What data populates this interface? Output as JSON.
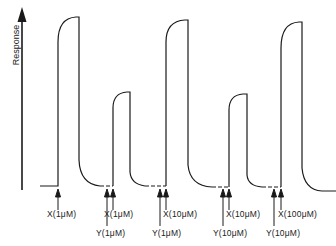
{
  "diagram": {
    "y_axis_label": "Response",
    "traces": [
      {
        "id": "peak-1",
        "height": "large"
      },
      {
        "id": "peak-2",
        "height": "small"
      },
      {
        "id": "peak-3",
        "height": "large"
      },
      {
        "id": "peak-4",
        "height": "small"
      },
      {
        "id": "peak-5",
        "height": "large"
      }
    ],
    "markers": {
      "x1": "X(1μM)",
      "y1a": "Y(1μM)",
      "x2": "X(1μM)",
      "y2": "Y(1μM)",
      "x3": "X(10μM)",
      "y3": "Y(10μM)",
      "x4": "X(10μM)",
      "y4": "Y(10μM)",
      "x5": "X(100μM)"
    },
    "colors": {
      "line": "#1a1a1a",
      "background": "#ffffff"
    }
  }
}
